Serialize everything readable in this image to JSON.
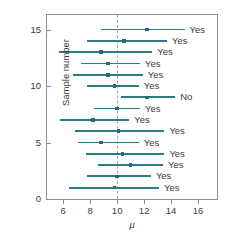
{
  "chart_data": {
    "type": "scatter",
    "title": "",
    "xlabel": "μ",
    "ylabel": "Sample number",
    "xlim": [
      4.8,
      17.4
    ],
    "ylim": [
      0,
      16.3
    ],
    "grid": false,
    "legend": null,
    "reference_line": {
      "x": 10,
      "style": "dashed",
      "color": "#a9a9a9"
    },
    "xticks": [
      6,
      8,
      10,
      12,
      14,
      16
    ],
    "xticklabels": [
      "6",
      "8",
      "10",
      "12",
      "14",
      "16"
    ],
    "yticks": [
      0,
      5,
      10,
      15
    ],
    "yticklabels": [
      "0",
      "5",
      "10",
      "15"
    ],
    "series_color": "#2d7a88",
    "annotation_column_header": "Contains μ = 10?",
    "intervals": [
      {
        "sample": 15,
        "center": 12.2,
        "lower": 8.8,
        "upper": 15.0,
        "contains_mu": "Yes"
      },
      {
        "sample": 14,
        "center": 10.5,
        "lower": 7.8,
        "upper": 13.7,
        "contains_mu": "Yes"
      },
      {
        "sample": 13,
        "center": 8.8,
        "lower": 5.7,
        "upper": 12.6,
        "contains_mu": "Yes"
      },
      {
        "sample": 12,
        "center": 9.3,
        "lower": 7.3,
        "upper": 11.7,
        "contains_mu": "Yes"
      },
      {
        "sample": 11,
        "center": 9.3,
        "lower": 6.7,
        "upper": 11.9,
        "contains_mu": "Yes"
      },
      {
        "sample": 10,
        "center": 9.8,
        "lower": 7.8,
        "upper": 11.6,
        "contains_mu": "Yes"
      },
      {
        "sample": 9,
        "center": 12.2,
        "lower": 10.3,
        "upper": 14.3,
        "contains_mu": "No"
      },
      {
        "sample": 8,
        "center": 10.0,
        "lower": 8.3,
        "upper": 11.7,
        "contains_mu": "Yes"
      },
      {
        "sample": 7,
        "center": 8.2,
        "lower": 5.8,
        "upper": 10.9,
        "contains_mu": "Yes"
      },
      {
        "sample": 6,
        "center": 10.1,
        "lower": 6.9,
        "upper": 13.5,
        "contains_mu": "Yes"
      },
      {
        "sample": 5,
        "center": 8.8,
        "lower": 7.1,
        "upper": 11.6,
        "contains_mu": "Yes"
      },
      {
        "sample": 4,
        "center": 10.4,
        "lower": 7.7,
        "upper": 13.5,
        "contains_mu": "Yes"
      },
      {
        "sample": 3,
        "center": 11.0,
        "lower": 8.6,
        "upper": 13.4,
        "contains_mu": "Yes"
      },
      {
        "sample": 2,
        "center": 10.0,
        "lower": 7.8,
        "upper": 12.5,
        "contains_mu": "Yes"
      },
      {
        "sample": 1,
        "center": 9.8,
        "lower": 6.4,
        "upper": 13.1,
        "contains_mu": "Yes"
      }
    ]
  }
}
